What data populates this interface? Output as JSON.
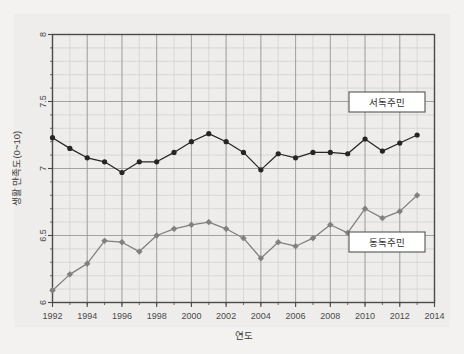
{
  "chart_data": {
    "type": "line",
    "title": "",
    "xlabel": "연도",
    "ylabel": "생활 만족도(0~10)",
    "xlim": [
      1992,
      2014
    ],
    "ylim": [
      6,
      8
    ],
    "xticks": [
      1992,
      1994,
      1996,
      1998,
      2000,
      2002,
      2004,
      2006,
      2008,
      2010,
      2012,
      2014
    ],
    "yticks": [
      6,
      6.5,
      7,
      7.5,
      8
    ],
    "xtick_labels": [
      "1992",
      "1994",
      "1996",
      "1998",
      "2000",
      "2002",
      "2004",
      "2006",
      "2008",
      "2010",
      "2012",
      "2014"
    ],
    "ytick_labels": [
      "6",
      "6.5",
      "7",
      "7.5",
      "8"
    ],
    "grid": true,
    "minor_grid": true,
    "minor_x_step": 1,
    "minor_y_step": 0.1,
    "legend_position": "inside-right",
    "x": [
      1992,
      1993,
      1994,
      1995,
      1996,
      1997,
      1998,
      1999,
      2000,
      2001,
      2002,
      2003,
      2004,
      2005,
      2006,
      2007,
      2008,
      2009,
      2010,
      2011,
      2012,
      2013
    ],
    "series": [
      {
        "name": "서독주민",
        "color": "#262626",
        "marker": "circle",
        "values": [
          7.23,
          7.15,
          7.08,
          7.05,
          6.97,
          7.05,
          7.05,
          7.12,
          7.2,
          7.26,
          7.2,
          7.12,
          6.99,
          7.11,
          7.08,
          7.12,
          7.12,
          7.11,
          7.22,
          7.13,
          7.19,
          7.25
        ]
      },
      {
        "name": "동독주민",
        "color": "#7f7f7f",
        "marker": "diamond",
        "values": [
          6.09,
          6.21,
          6.29,
          6.46,
          6.45,
          6.38,
          6.5,
          6.55,
          6.58,
          6.6,
          6.55,
          6.48,
          6.33,
          6.45,
          6.42,
          6.48,
          6.58,
          6.52,
          6.7,
          6.63,
          6.68,
          6.8
        ]
      }
    ]
  },
  "legend": {
    "items": [
      {
        "label": "서독주민"
      },
      {
        "label": "동독주민"
      }
    ]
  },
  "colors": {
    "west": "#262626",
    "east": "#7f7f7f",
    "grid_major": "#9a9a9a",
    "grid_minor": "#cfcfcf",
    "frame": "#4a4a4a",
    "paper": "#eeedeb",
    "page": "#f3f2f0"
  }
}
